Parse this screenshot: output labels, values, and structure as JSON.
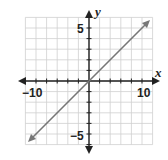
{
  "chart_data": {
    "type": "line",
    "title": "",
    "xlabel": "x",
    "ylabel": "y",
    "xlim": [
      -12,
      12
    ],
    "ylim": [
      -12,
      12
    ],
    "grid": true,
    "grid_step": 2,
    "x_tick_labels": [
      "-10",
      "10"
    ],
    "y_tick_labels": [
      "5",
      "-5"
    ],
    "series": [
      {
        "name": "line",
        "equation": "y = x",
        "x": [
          -11,
          11
        ],
        "y": [
          -11,
          11
        ],
        "color": "#777777",
        "arrows_both_ends": true
      }
    ]
  },
  "labels": {
    "x_axis": "x",
    "y_axis": "y",
    "x_neg": "−10",
    "x_pos": "10",
    "y_pos": "5",
    "y_neg": "−5"
  }
}
